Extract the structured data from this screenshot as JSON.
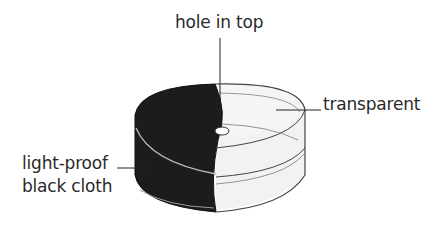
{
  "figure": {
    "labels": {
      "hole": "hole in top",
      "transparent": "transparent",
      "cloth_line1": "light-proof",
      "cloth_line2": "black cloth"
    },
    "colors": {
      "cloth": "#1c1c1c",
      "transparent_fill": "#f4f4f4",
      "outline": "#2a2a2a",
      "text": "#2a2a2a"
    }
  }
}
